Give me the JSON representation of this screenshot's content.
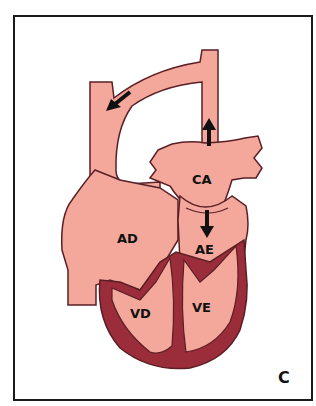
{
  "figure": {
    "panel_letter": "C",
    "colors": {
      "chamber_fill": "#f4a79b",
      "myocardium": "#9b2d3a",
      "outline": "#5a1f25",
      "arrow": "#111111",
      "frame": "#1a1a1a"
    },
    "labels": {
      "left_atrium": "CA",
      "right_atrium": "AD",
      "common_atrium": "AE",
      "right_ventricle": "VD",
      "left_ventricle": "VE"
    },
    "arrows": [
      {
        "name": "flow-arrow-down-left",
        "direction": "down-left"
      },
      {
        "name": "flow-arrow-up",
        "direction": "up"
      },
      {
        "name": "flow-arrow-down",
        "direction": "down"
      }
    ]
  }
}
